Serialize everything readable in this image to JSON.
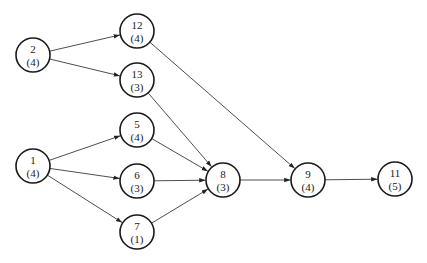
{
  "diagram": {
    "type": "network-activity-graph",
    "nodes": [
      {
        "id": "2",
        "label": "2",
        "duration": "(4)"
      },
      {
        "id": "12",
        "label": "12",
        "duration": "(4)"
      },
      {
        "id": "13",
        "label": "13",
        "duration": "(3)"
      },
      {
        "id": "1",
        "label": "1",
        "duration": "(4)"
      },
      {
        "id": "5",
        "label": "5",
        "duration": "(4)"
      },
      {
        "id": "6",
        "label": "6",
        "duration": "(3)"
      },
      {
        "id": "7",
        "label": "7",
        "duration": "(1)"
      },
      {
        "id": "8",
        "label": "8",
        "duration": "(3)"
      },
      {
        "id": "9",
        "label": "9",
        "duration": "(4)"
      },
      {
        "id": "11",
        "label": "11",
        "duration": "(5)"
      }
    ],
    "edges": [
      {
        "from": "2",
        "to": "12"
      },
      {
        "from": "2",
        "to": "13"
      },
      {
        "from": "1",
        "to": "5"
      },
      {
        "from": "1",
        "to": "6"
      },
      {
        "from": "1",
        "to": "7"
      },
      {
        "from": "13",
        "to": "8"
      },
      {
        "from": "5",
        "to": "8"
      },
      {
        "from": "6",
        "to": "8"
      },
      {
        "from": "7",
        "to": "8"
      },
      {
        "from": "12",
        "to": "9"
      },
      {
        "from": "8",
        "to": "9"
      },
      {
        "from": "9",
        "to": "11"
      }
    ]
  }
}
